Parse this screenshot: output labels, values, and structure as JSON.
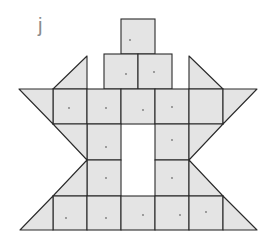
{
  "figure": {
    "label": "j",
    "fill_color": "#e4e4e4",
    "stroke_color": "#2a2a2a",
    "shape_counts": {
      "squares": 18,
      "triangles": 8
    }
  }
}
